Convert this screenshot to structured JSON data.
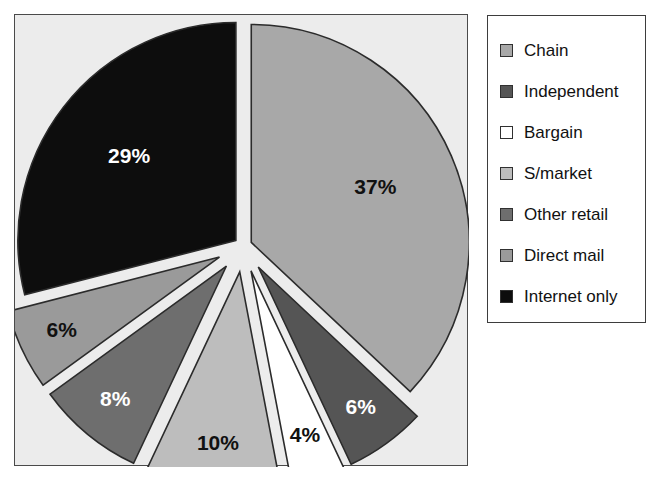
{
  "chart_data": {
    "type": "pie",
    "title": "",
    "subtitle": "",
    "xlabel": "",
    "ylabel": "",
    "exploded": true,
    "grid": false,
    "legend_position": "right",
    "start_angle_deg": 0,
    "direction": "clockwise",
    "total": 100,
    "categories": [
      "Chain",
      "Independent",
      "Bargain",
      "S/market",
      "Other retail",
      "Direct mail",
      "Internet only"
    ],
    "values": [
      37,
      6,
      4,
      10,
      8,
      6,
      29
    ],
    "labels": [
      "37%",
      "6%",
      "4%",
      "10%",
      "8%",
      "6%",
      "29%"
    ],
    "colors": [
      "#a8a8a8",
      "#555555",
      "#ffffff",
      "#bdbdbd",
      "#6e6e6e",
      "#9a9a9a",
      "#0d0d0d"
    ],
    "label_colors": [
      "#111111",
      "#ffffff",
      "#111111",
      "#111111",
      "#ffffff",
      "#111111",
      "#ffffff"
    ],
    "slice_border_color": "#2b2b2b",
    "plot_background": "#ececec",
    "page_background": "#ffffff",
    "slices": [
      {
        "name": "Chain",
        "value": 37,
        "label": "37%",
        "color": "#a8a8a8",
        "label_color": "#111111"
      },
      {
        "name": "Independent",
        "value": 6,
        "label": "6%",
        "color": "#555555",
        "label_color": "#ffffff"
      },
      {
        "name": "Bargain",
        "value": 4,
        "label": "4%",
        "color": "#ffffff",
        "label_color": "#111111"
      },
      {
        "name": "S/market",
        "value": 10,
        "label": "10%",
        "color": "#bdbdbd",
        "label_color": "#111111"
      },
      {
        "name": "Other retail",
        "value": 8,
        "label": "8%",
        "color": "#6e6e6e",
        "label_color": "#ffffff"
      },
      {
        "name": "Direct mail",
        "value": 6,
        "label": "6%",
        "color": "#9a9a9a",
        "label_color": "#111111"
      },
      {
        "name": "Internet only",
        "value": 29,
        "label": "29%",
        "color": "#0d0d0d",
        "label_color": "#ffffff"
      }
    ]
  },
  "legend": {
    "items": [
      {
        "label": "Chain",
        "color": "#a8a8a8"
      },
      {
        "label": "Independent",
        "color": "#555555"
      },
      {
        "label": "Bargain",
        "color": "#ffffff"
      },
      {
        "label": "S/market",
        "color": "#bdbdbd"
      },
      {
        "label": "Other retail",
        "color": "#6e6e6e"
      },
      {
        "label": "Direct mail",
        "color": "#9a9a9a"
      },
      {
        "label": "Internet only",
        "color": "#0d0d0d"
      }
    ]
  }
}
